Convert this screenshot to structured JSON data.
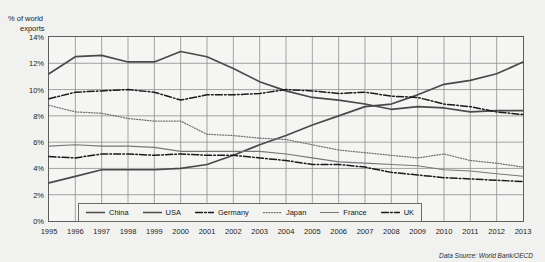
{
  "axis": {
    "y_title_line1": "% of world",
    "y_title_line2": "exports",
    "y_ticks": [
      "14%",
      "12%",
      "10%",
      "8%",
      "6%",
      "4%",
      "2%",
      "0%"
    ],
    "x_ticks": [
      "1995",
      "1996",
      "1997",
      "1998",
      "1999",
      "2000",
      "2001",
      "2002",
      "2003",
      "2004",
      "2005",
      "2006",
      "2007",
      "2008",
      "2009",
      "2010",
      "2011",
      "2012",
      "2013"
    ]
  },
  "legend": {
    "items": [
      {
        "label": "China",
        "style": "solid-thick",
        "color": "#4a4a4a"
      },
      {
        "label": "USA",
        "style": "solid-thick",
        "color": "#4a4a4a"
      },
      {
        "label": "Germany",
        "style": "dash-dot",
        "color": "#1a1a1a"
      },
      {
        "label": "Japan",
        "style": "dotted",
        "color": "#6f6f6f"
      },
      {
        "label": "France",
        "style": "solid-thin",
        "color": "#777777"
      },
      {
        "label": "UK",
        "style": "dash-dot",
        "color": "#1a1a1a"
      }
    ]
  },
  "footer": {
    "source": "Data Source: World Bank/OECD"
  },
  "chart_data": {
    "type": "line",
    "title": "",
    "xlabel": "",
    "ylabel": "% of world exports",
    "ylim": [
      0,
      14
    ],
    "grid": true,
    "legend_position": "bottom-inside",
    "x": [
      1995,
      1996,
      1997,
      1998,
      1999,
      2000,
      2001,
      2002,
      2003,
      2004,
      2005,
      2006,
      2007,
      2008,
      2009,
      2010,
      2011,
      2012,
      2013
    ],
    "series": [
      {
        "name": "China",
        "values": [
          2.9,
          3.4,
          3.9,
          3.9,
          3.9,
          4.0,
          4.3,
          5.0,
          5.8,
          6.5,
          7.3,
          8.0,
          8.7,
          8.9,
          9.6,
          10.4,
          10.7,
          11.2,
          12.1
        ]
      },
      {
        "name": "USA",
        "values": [
          11.2,
          12.5,
          12.6,
          12.1,
          12.1,
          12.9,
          12.5,
          11.6,
          10.6,
          9.9,
          9.4,
          9.2,
          8.9,
          8.5,
          8.7,
          8.6,
          8.3,
          8.4,
          8.4
        ]
      },
      {
        "name": "Germany",
        "values": [
          9.3,
          9.8,
          9.9,
          10.0,
          9.8,
          9.2,
          9.6,
          9.6,
          9.7,
          10.0,
          9.9,
          9.7,
          9.8,
          9.5,
          9.4,
          8.9,
          8.7,
          8.3,
          8.1
        ]
      },
      {
        "name": "Japan",
        "values": [
          8.8,
          8.3,
          8.2,
          7.8,
          7.6,
          7.6,
          6.6,
          6.5,
          6.3,
          6.2,
          5.8,
          5.4,
          5.2,
          5.0,
          4.8,
          5.1,
          4.6,
          4.4,
          4.1
        ]
      },
      {
        "name": "France",
        "values": [
          5.7,
          5.8,
          5.7,
          5.7,
          5.6,
          5.3,
          5.3,
          5.3,
          5.3,
          5.1,
          4.8,
          4.5,
          4.4,
          4.3,
          4.2,
          3.9,
          3.8,
          3.6,
          3.4
        ]
      },
      {
        "name": "UK",
        "values": [
          4.9,
          4.8,
          5.1,
          5.1,
          5.0,
          5.1,
          5.0,
          5.0,
          4.8,
          4.6,
          4.3,
          4.3,
          4.1,
          3.7,
          3.5,
          3.3,
          3.2,
          3.1,
          3.0
        ]
      }
    ]
  }
}
